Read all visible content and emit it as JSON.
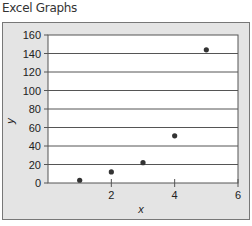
{
  "page": {
    "title": "Excel Graphs"
  },
  "chart_data": {
    "type": "scatter",
    "title": "",
    "xlabel": "x",
    "ylabel": "y",
    "xlim": [
      0,
      6
    ],
    "ylim": [
      0,
      160
    ],
    "x_ticks": [
      2,
      4,
      6
    ],
    "y_ticks": [
      0,
      20,
      40,
      60,
      80,
      100,
      120,
      140,
      160
    ],
    "grid": {
      "horizontal": true,
      "vertical": false
    },
    "legend": null,
    "series": [
      {
        "name": "y",
        "x": [
          1,
          2,
          3,
          4,
          5
        ],
        "values": [
          3,
          12,
          22,
          51,
          144
        ],
        "marker": "circle",
        "color": "#333333"
      }
    ],
    "colors": {
      "plot_bg": "#ffffff",
      "chart_bg": "#e4e4e4",
      "gridline": "#555555",
      "marker": "#333333"
    }
  }
}
